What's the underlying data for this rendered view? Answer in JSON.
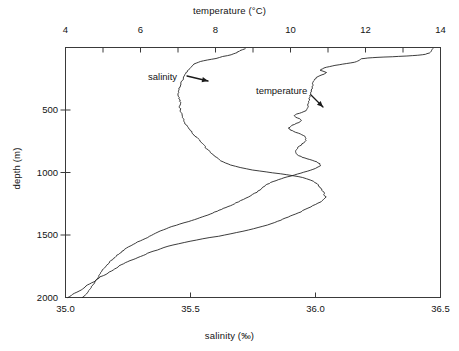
{
  "chart_data": {
    "type": "line",
    "title": "",
    "xlabel": "salinity (‰)",
    "x2label": "temperature (°C)",
    "ylabel": "depth (m)",
    "ylim": [
      0,
      2000
    ],
    "y_inverted": true,
    "grid": false,
    "legend_position": "inline-annotation",
    "axes": {
      "top": {
        "label": "temperature (°C)",
        "range": [
          4,
          14
        ],
        "ticks": [
          4,
          6,
          8,
          10,
          12,
          14
        ],
        "tick_labels": [
          "4",
          "6",
          "8",
          "10",
          "12",
          "14"
        ],
        "minor_tick_step": 1
      },
      "bottom": {
        "label": "salinity (‰)",
        "range": [
          35.0,
          36.5
        ],
        "ticks": [
          35.0,
          35.5,
          36.0,
          36.5
        ],
        "tick_labels": [
          "35.0",
          "35.5",
          "36.0",
          "36.5"
        ],
        "minor_tick_step": 0.5
      },
      "left": {
        "label": "depth (m)",
        "range": [
          0,
          2000
        ],
        "ticks": [
          500,
          1000,
          1500,
          2000
        ],
        "tick_labels": [
          "500",
          "1000",
          "1500",
          "2000"
        ]
      }
    },
    "annotations": [
      {
        "text": "salinity",
        "target_series": "salinity",
        "arrow": "points right-down toward salinity profile",
        "x_px": 148,
        "y_px": 71
      },
      {
        "text": "temperature",
        "target_series": "temperature",
        "arrow": "points down-right toward temperature profile",
        "x_px": 256,
        "y_px": 85
      }
    ],
    "series": [
      {
        "name": "salinity",
        "unit": "‰",
        "axis": "bottom",
        "color": "#1a1a1a",
        "points": [
          [
            35.72,
            10
          ],
          [
            35.7,
            25
          ],
          [
            35.69,
            35
          ],
          [
            35.68,
            45
          ],
          [
            35.66,
            58
          ],
          [
            35.63,
            72
          ],
          [
            35.6,
            88
          ],
          [
            35.57,
            100
          ],
          [
            35.54,
            112
          ],
          [
            35.52,
            125
          ],
          [
            35.51,
            140
          ],
          [
            35.5,
            160
          ],
          [
            35.49,
            185
          ],
          [
            35.48,
            210
          ],
          [
            35.475,
            235
          ],
          [
            35.47,
            255
          ],
          [
            35.465,
            275
          ],
          [
            35.46,
            300
          ],
          [
            35.455,
            325
          ],
          [
            35.45,
            350
          ],
          [
            35.45,
            380
          ],
          [
            35.455,
            410
          ],
          [
            35.46,
            440
          ],
          [
            35.455,
            470
          ],
          [
            35.46,
            500
          ],
          [
            35.465,
            530
          ],
          [
            35.47,
            560
          ],
          [
            35.475,
            585
          ],
          [
            35.48,
            610
          ],
          [
            35.49,
            640
          ],
          [
            35.5,
            665
          ],
          [
            35.51,
            690
          ],
          [
            35.525,
            720
          ],
          [
            35.54,
            750
          ],
          [
            35.55,
            775
          ],
          [
            35.56,
            800
          ],
          [
            35.575,
            830
          ],
          [
            35.59,
            860
          ],
          [
            35.61,
            890
          ],
          [
            35.63,
            915
          ],
          [
            35.66,
            940
          ],
          [
            35.7,
            960
          ],
          [
            35.75,
            980
          ],
          [
            35.8,
            995
          ],
          [
            35.86,
            1010
          ],
          [
            35.91,
            1025
          ],
          [
            35.95,
            1040
          ],
          [
            35.98,
            1060
          ],
          [
            36.0,
            1080
          ],
          [
            36.01,
            1100
          ],
          [
            36.02,
            1125
          ],
          [
            36.03,
            1150
          ],
          [
            36.035,
            1175
          ],
          [
            36.04,
            1195
          ],
          [
            36.03,
            1215
          ],
          [
            36.02,
            1235
          ],
          [
            36.0,
            1255
          ],
          [
            35.98,
            1275
          ],
          [
            35.96,
            1295
          ],
          [
            35.94,
            1315
          ],
          [
            35.91,
            1340
          ],
          [
            35.88,
            1365
          ],
          [
            35.85,
            1390
          ],
          [
            35.82,
            1410
          ],
          [
            35.79,
            1430
          ],
          [
            35.75,
            1450
          ],
          [
            35.71,
            1470
          ],
          [
            35.66,
            1490
          ],
          [
            35.61,
            1510
          ],
          [
            35.55,
            1530
          ],
          [
            35.5,
            1550
          ],
          [
            35.45,
            1570
          ],
          [
            35.41,
            1590
          ],
          [
            35.38,
            1610
          ],
          [
            35.35,
            1630
          ],
          [
            35.32,
            1655
          ],
          [
            35.29,
            1680
          ],
          [
            35.26,
            1705
          ],
          [
            35.23,
            1730
          ],
          [
            35.21,
            1755
          ],
          [
            35.19,
            1780
          ],
          [
            35.17,
            1805
          ],
          [
            35.14,
            1835
          ],
          [
            35.12,
            1865
          ],
          [
            35.09,
            1900
          ],
          [
            35.06,
            1940
          ],
          [
            35.03,
            1975
          ],
          [
            35.01,
            2000
          ]
        ]
      },
      {
        "name": "temperature",
        "unit": "°C",
        "axis": "top",
        "color": "#1a1a1a",
        "points": [
          [
            13.8,
            8
          ],
          [
            13.78,
            20
          ],
          [
            13.75,
            32
          ],
          [
            13.7,
            44
          ],
          [
            13.6,
            54
          ],
          [
            13.4,
            62
          ],
          [
            13.1,
            68
          ],
          [
            12.7,
            74
          ],
          [
            12.3,
            79
          ],
          [
            12.05,
            84
          ],
          [
            11.9,
            90
          ],
          [
            11.85,
            98
          ],
          [
            11.8,
            108
          ],
          [
            11.7,
            118
          ],
          [
            11.5,
            128
          ],
          [
            11.3,
            138
          ],
          [
            11.1,
            148
          ],
          [
            10.95,
            158
          ],
          [
            10.85,
            170
          ],
          [
            10.8,
            182
          ],
          [
            10.88,
            192
          ],
          [
            10.95,
            200
          ],
          [
            10.9,
            212
          ],
          [
            10.8,
            225
          ],
          [
            10.7,
            240
          ],
          [
            10.65,
            255
          ],
          [
            10.62,
            270
          ],
          [
            10.6,
            290
          ],
          [
            10.58,
            315
          ],
          [
            10.56,
            340
          ],
          [
            10.55,
            365
          ],
          [
            10.52,
            390
          ],
          [
            10.5,
            420
          ],
          [
            10.48,
            450
          ],
          [
            10.45,
            480
          ],
          [
            10.42,
            505
          ],
          [
            10.3,
            520
          ],
          [
            10.18,
            532
          ],
          [
            10.1,
            545
          ],
          [
            10.15,
            558
          ],
          [
            10.25,
            570
          ],
          [
            10.3,
            585
          ],
          [
            10.22,
            600
          ],
          [
            10.1,
            615
          ],
          [
            10.0,
            630
          ],
          [
            9.95,
            645
          ],
          [
            10.0,
            660
          ],
          [
            10.1,
            672
          ],
          [
            10.2,
            685
          ],
          [
            10.3,
            698
          ],
          [
            10.38,
            712
          ],
          [
            10.42,
            728
          ],
          [
            10.4,
            745
          ],
          [
            10.35,
            762
          ],
          [
            10.28,
            780
          ],
          [
            10.2,
            798
          ],
          [
            10.15,
            815
          ],
          [
            10.12,
            832
          ],
          [
            10.15,
            850
          ],
          [
            10.22,
            865
          ],
          [
            10.32,
            878
          ],
          [
            10.45,
            890
          ],
          [
            10.58,
            902
          ],
          [
            10.7,
            915
          ],
          [
            10.78,
            930
          ],
          [
            10.8,
            945
          ],
          [
            10.72,
            960
          ],
          [
            10.6,
            975
          ],
          [
            10.45,
            990
          ],
          [
            10.28,
            1005
          ],
          [
            10.1,
            1020
          ],
          [
            9.92,
            1035
          ],
          [
            9.75,
            1050
          ],
          [
            9.6,
            1065
          ],
          [
            9.48,
            1080
          ],
          [
            9.38,
            1095
          ],
          [
            9.3,
            1110
          ],
          [
            9.24,
            1125
          ],
          [
            9.18,
            1140
          ],
          [
            9.1,
            1158
          ],
          [
            9.0,
            1175
          ],
          [
            8.88,
            1195
          ],
          [
            8.75,
            1215
          ],
          [
            8.6,
            1235
          ],
          [
            8.45,
            1258
          ],
          [
            8.28,
            1280
          ],
          [
            8.1,
            1302
          ],
          [
            7.92,
            1325
          ],
          [
            7.72,
            1348
          ],
          [
            7.5,
            1370
          ],
          [
            7.28,
            1392
          ],
          [
            7.05,
            1412
          ],
          [
            6.85,
            1432
          ],
          [
            6.68,
            1450
          ],
          [
            6.52,
            1468
          ],
          [
            6.4,
            1485
          ],
          [
            6.3,
            1502
          ],
          [
            6.18,
            1520
          ],
          [
            6.05,
            1538
          ],
          [
            5.92,
            1556
          ],
          [
            5.8,
            1575
          ],
          [
            5.68,
            1595
          ],
          [
            5.58,
            1615
          ],
          [
            5.48,
            1638
          ],
          [
            5.38,
            1662
          ],
          [
            5.28,
            1688
          ],
          [
            5.18,
            1715
          ],
          [
            5.1,
            1742
          ],
          [
            5.02,
            1770
          ],
          [
            4.95,
            1800
          ],
          [
            4.88,
            1832
          ],
          [
            4.8,
            1868
          ],
          [
            4.72,
            1905
          ],
          [
            4.62,
            1945
          ],
          [
            4.52,
            1980
          ],
          [
            4.45,
            2000
          ]
        ]
      }
    ]
  },
  "top_axis_title": "temperature (°C)",
  "bottom_axis_title": "salinity (‰)",
  "depth_axis_title": "depth (m)",
  "annotation_salinity": "salinity",
  "annotation_temperature": "temperature"
}
